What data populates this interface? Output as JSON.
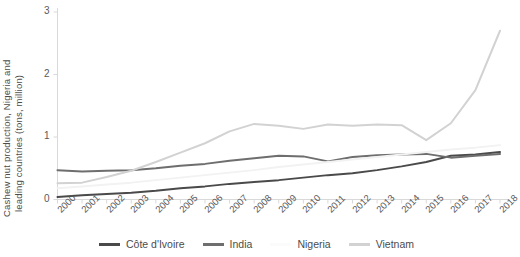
{
  "chart_data": {
    "type": "line",
    "title": "",
    "xlabel": "",
    "ylabel": "Cashew nut production, Nigeria and leading countries (tons, million)",
    "ylabel_line1": "Cashew nut production, Nigeria and",
    "ylabel_line2": "leading countries (tons, million)",
    "categories": [
      "2000",
      "2001",
      "2002",
      "2003",
      "2004",
      "2005",
      "2006",
      "2007",
      "2008",
      "2009",
      "2010",
      "2011",
      "2012",
      "2013",
      "2014",
      "2015",
      "2016",
      "2017",
      "2018"
    ],
    "x": [
      2000,
      2001,
      2002,
      2003,
      2004,
      2005,
      2006,
      2007,
      2008,
      2009,
      2010,
      2011,
      2012,
      2013,
      2014,
      2015,
      2016,
      2017,
      2018
    ],
    "ylim": [
      0,
      3
    ],
    "yticks": [
      0,
      1,
      2,
      3
    ],
    "ytick_labels": [
      "0",
      "1",
      "2",
      "3"
    ],
    "xlim": [
      2000,
      2018
    ],
    "grid": false,
    "legend_position": "bottom",
    "series": [
      {
        "name": "Côte d'Ivoire",
        "color": "#4a4a4a",
        "values": [
          0.04,
          0.07,
          0.09,
          0.11,
          0.14,
          0.18,
          0.21,
          0.25,
          0.28,
          0.31,
          0.35,
          0.39,
          0.42,
          0.47,
          0.53,
          0.6,
          0.7,
          0.72,
          0.76
        ]
      },
      {
        "name": "India",
        "color": "#6e6e6e",
        "values": [
          0.47,
          0.45,
          0.46,
          0.47,
          0.5,
          0.54,
          0.57,
          0.62,
          0.66,
          0.7,
          0.69,
          0.61,
          0.68,
          0.71,
          0.72,
          0.73,
          0.67,
          0.7,
          0.73
        ]
      },
      {
        "name": "Nigeria",
        "color": "#f2f2f2",
        "values": [
          0.18,
          0.21,
          0.24,
          0.27,
          0.31,
          0.35,
          0.39,
          0.43,
          0.47,
          0.52,
          0.56,
          0.6,
          0.64,
          0.68,
          0.72,
          0.76,
          0.8,
          0.83,
          0.87
        ]
      },
      {
        "name": "Vietnam",
        "color": "#d2d2d2",
        "values": [
          0.26,
          0.27,
          0.36,
          0.46,
          0.6,
          0.75,
          0.9,
          1.09,
          1.21,
          1.18,
          1.13,
          1.2,
          1.18,
          1.2,
          1.19,
          0.95,
          1.22,
          1.75,
          2.7
        ]
      }
    ]
  },
  "legend": {
    "items": [
      {
        "label": "Côte d'Ivoire",
        "color": "#4a4a4a"
      },
      {
        "label": "India",
        "color": "#6e6e6e"
      },
      {
        "label": "Nigeria",
        "color": "#fbfbfb"
      },
      {
        "label": "Vietnam",
        "color": "#d2d2d2"
      }
    ]
  },
  "axes": {
    "axis_color": "#d9d9d9",
    "tick_color": "#d9d9d9",
    "text_color": "#59595b"
  }
}
